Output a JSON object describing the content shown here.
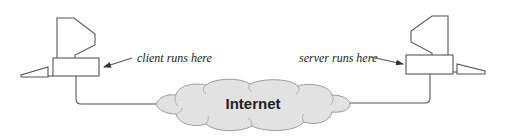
{
  "diagram": {
    "type": "client-server network diagram",
    "client": {
      "label": "client runs here",
      "icon": "desktop-computer-icon"
    },
    "server": {
      "label": "server runs here",
      "icon": "desktop-computer-icon"
    },
    "network": {
      "label": "Internet",
      "icon": "cloud-icon",
      "fill": "#e2e2e2"
    },
    "colors": {
      "stroke": "#555555",
      "text": "#222222",
      "background": "#ffffff"
    }
  }
}
